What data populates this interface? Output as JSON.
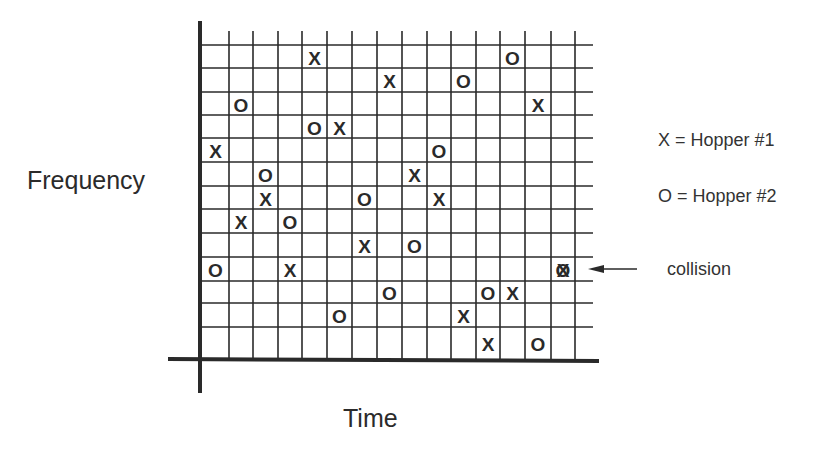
{
  "labels": {
    "y_axis": "Frequency",
    "x_axis": "Time"
  },
  "legend": [
    {
      "symbol": "X",
      "label": "X = Hopper #1"
    },
    {
      "symbol": "O",
      "label": "O = Hopper #2"
    }
  ],
  "annotation": {
    "text": "collision",
    "points_to": {
      "col": 14,
      "row": 9
    }
  },
  "grid": {
    "columns": 16,
    "rows": 13,
    "col_lines_x": [
      202,
      229,
      253,
      278,
      302,
      327,
      352,
      377,
      402,
      427,
      451,
      476,
      500,
      525,
      551,
      575
    ],
    "row_lines_y": [
      45,
      68,
      92,
      115,
      138,
      162,
      186,
      209,
      233,
      257,
      281,
      303,
      327
    ],
    "grid_right": 593,
    "grid_top": 31,
    "axis_y": 359,
    "axis_x": 200
  },
  "colors": {
    "ink": "#2a2a2a",
    "background": "#ffffff"
  },
  "chart_data": {
    "type": "scatter",
    "title": "",
    "xlabel": "Time",
    "ylabel": "Frequency",
    "grid": true,
    "legend_position": "right",
    "note": "Row 0 = top (highest frequency); column 0 = leftmost (earliest time).",
    "series": [
      {
        "name": "Hopper #1",
        "marker": "X",
        "points": [
          {
            "col": 4,
            "row": 0
          },
          {
            "col": 7,
            "row": 1
          },
          {
            "col": 13,
            "row": 2
          },
          {
            "col": 5,
            "row": 3
          },
          {
            "col": 0,
            "row": 4
          },
          {
            "col": 8,
            "row": 5
          },
          {
            "col": 2,
            "row": 6
          },
          {
            "col": 9,
            "row": 6
          },
          {
            "col": 1,
            "row": 7
          },
          {
            "col": 6,
            "row": 8
          },
          {
            "col": 3,
            "row": 9
          },
          {
            "col": 14,
            "row": 9
          },
          {
            "col": 12,
            "row": 10
          },
          {
            "col": 10,
            "row": 11
          },
          {
            "col": 11,
            "row": 12
          }
        ]
      },
      {
        "name": "Hopper #2",
        "marker": "O",
        "points": [
          {
            "col": 12,
            "row": 0
          },
          {
            "col": 10,
            "row": 1
          },
          {
            "col": 1,
            "row": 2
          },
          {
            "col": 4,
            "row": 3
          },
          {
            "col": 9,
            "row": 4
          },
          {
            "col": 2,
            "row": 5
          },
          {
            "col": 6,
            "row": 6
          },
          {
            "col": 3,
            "row": 7
          },
          {
            "col": 8,
            "row": 8
          },
          {
            "col": 0,
            "row": 9
          },
          {
            "col": 14,
            "row": 9
          },
          {
            "col": 7,
            "row": 10
          },
          {
            "col": 11,
            "row": 10
          },
          {
            "col": 5,
            "row": 11
          },
          {
            "col": 13,
            "row": 12
          }
        ]
      }
    ],
    "collisions": [
      {
        "col": 14,
        "row": 9,
        "label": "collision"
      }
    ]
  }
}
